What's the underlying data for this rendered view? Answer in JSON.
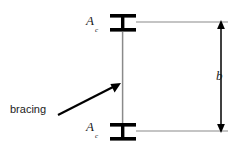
{
  "figure": {
    "type": "engineering-diagram",
    "background_color": "#ffffff",
    "ink_color": "#000000",
    "thin_line_color": "#808080"
  },
  "labels": {
    "area_top": {
      "symbol": "A",
      "subscript": "c"
    },
    "area_bottom": {
      "symbol": "A",
      "subscript": "c"
    },
    "dimension_b": "b",
    "bracing": "bracing"
  },
  "elements": {
    "top_ibeam": {
      "name": "top-i-section",
      "x": 110,
      "y": 14,
      "width": 26,
      "height": 18
    },
    "bottom_ibeam": {
      "name": "bottom-i-section",
      "x": 110,
      "y": 123,
      "width": 26,
      "height": 18
    },
    "column_line": {
      "name": "column-axis",
      "x": 122,
      "y1": 32,
      "y2": 123
    },
    "top_extension_line": {
      "name": "top-extension-line",
      "x1": 136,
      "x2": 228,
      "y": 22
    },
    "bottom_extension_line": {
      "name": "bottom-extension-line",
      "x1": 136,
      "x2": 228,
      "y": 131
    },
    "dimension_line": {
      "name": "dimension-line-b",
      "x": 221,
      "y1": 22,
      "y2": 131,
      "arrowheads": "both"
    },
    "bracing_leader": {
      "name": "bracing-leader-arrow",
      "x1": 60,
      "y1": 114,
      "x2": 119,
      "y2": 84
    }
  }
}
